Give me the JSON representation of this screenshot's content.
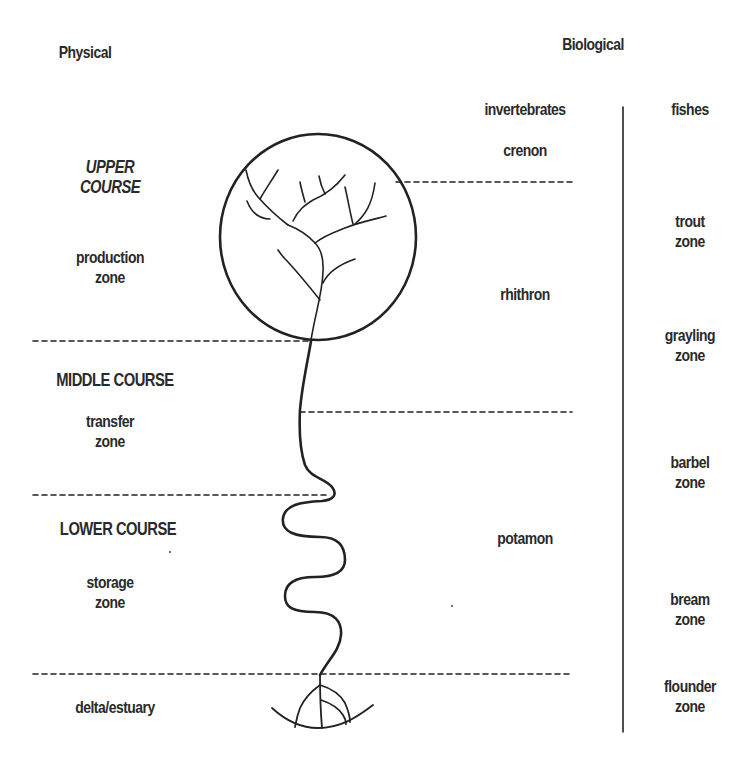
{
  "headings": {
    "physical": "Physical",
    "biological": "Biological"
  },
  "physical_zones": [
    {
      "course": "UPPER",
      "course2": "COURSE",
      "zone": "production",
      "zone2": "zone"
    },
    {
      "course": "MIDDLE COURSE",
      "zone": "transfer",
      "zone2": "zone"
    },
    {
      "course": "LOWER COURSE",
      "zone": "storage",
      "zone2": "zone"
    },
    {
      "zone": "delta/estuary"
    }
  ],
  "invertebrates": {
    "header": "invertebrates",
    "zones": [
      "crenon",
      "rhithron",
      "potamon"
    ]
  },
  "fishes": {
    "header": "fishes",
    "zones": [
      {
        "name": "trout",
        "suffix": "zone"
      },
      {
        "name": "grayling",
        "suffix": "zone"
      },
      {
        "name": "barbel",
        "suffix": "zone"
      },
      {
        "name": "bream",
        "suffix": "zone"
      },
      {
        "name": "flounder",
        "suffix": "zone"
      }
    ]
  },
  "colors": {
    "ink": "#222222",
    "background": "#ffffff"
  }
}
